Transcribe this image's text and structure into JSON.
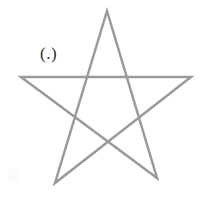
{
  "figure": {
    "label": "(.)",
    "background_color": "#ffffff",
    "stroke_color": "#9a9a9a",
    "stroke_width": 2.5,
    "label_color": "#2b2b2b",
    "canvas": {
      "width": 208,
      "height": 210
    }
  },
  "chart_data": {
    "type": "line",
    "title": "(.)",
    "xlabel": "",
    "ylabel": "",
    "xlim": [
      0,
      208
    ],
    "ylim": [
      210,
      0
    ],
    "grid": false,
    "legend": "none",
    "annotations": [
      {
        "text": "(.)",
        "x": 50,
        "y": 58
      }
    ],
    "series": [
      {
        "name": "pentagram-path",
        "closed": true,
        "points": [
          [
            107,
            11
          ],
          [
            157,
            178
          ],
          [
            21,
            77
          ],
          [
            191,
            77
          ],
          [
            55,
            183
          ],
          [
            107,
            11
          ]
        ]
      }
    ],
    "vertices": {
      "apex": [
        107,
        11
      ],
      "right": [
        191,
        77
      ],
      "bottom_right": [
        157,
        178
      ],
      "bottom_left": [
        55,
        183
      ],
      "left": [
        21,
        77
      ]
    }
  }
}
